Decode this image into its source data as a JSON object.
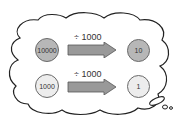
{
  "rows": [
    {
      "from": "10000",
      "operation": "÷ 1000",
      "to": "10",
      "shade": "dark"
    },
    {
      "from": "1000",
      "operation": "÷ 1000",
      "to": "1",
      "shade": "light"
    }
  ],
  "colors": {
    "coin_dark": "#b7b7b7",
    "coin_light": "#ededed",
    "arrow": "#999999",
    "outline": "#333333"
  }
}
